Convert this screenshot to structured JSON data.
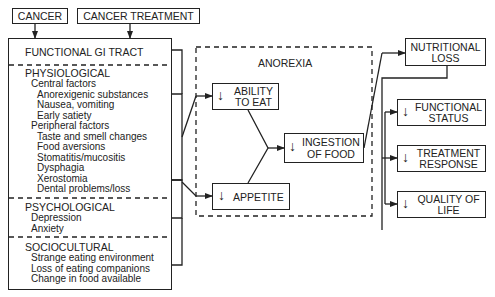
{
  "inputs": {
    "cancer": "CANCER",
    "cancer_treatment": "CANCER TREATMENT"
  },
  "causes_box": {
    "functional": "FUNCTIONAL GI TRACT",
    "physiological": {
      "title": "PHYSIOLOGICAL",
      "central_title": "Central factors",
      "central_items": [
        "Anorexigenic substances",
        "Nausea, vomiting",
        "Early satiety"
      ],
      "peripheral_title": "Peripheral factors",
      "peripheral_items": [
        "Taste and smell changes",
        "Food aversions",
        "Stomatitis/mucositis",
        "Dysphagia",
        "Xerostomia",
        "Dental problems/loss"
      ]
    },
    "psychological": {
      "title": "PSYCHOLOGICAL",
      "items": [
        "Depression",
        "Anxiety"
      ]
    },
    "sociocultural": {
      "title": "SOCIOCULTURAL",
      "items": [
        "Strange eating environment",
        "Loss of eating companions",
        "Change in food available"
      ]
    }
  },
  "anorexia": {
    "title": "ANOREXIA",
    "ability_line1": "ABILITY",
    "ability_line2": "TO EAT",
    "appetite": "APPETITE",
    "ingestion_line1": "INGESTION",
    "ingestion_line2": "OF FOOD"
  },
  "outcomes": {
    "nutritional_line1": "NUTRITIONAL",
    "nutritional_line2": "LOSS",
    "functional_line1": "FUNCTIONAL",
    "functional_line2": "STATUS",
    "treatment_line1": "TREATMENT",
    "treatment_line2": "RESPONSE",
    "quality_line1": "QUALITY OF",
    "quality_line2": "LIFE"
  },
  "symbols": {
    "decrease": "↓"
  }
}
